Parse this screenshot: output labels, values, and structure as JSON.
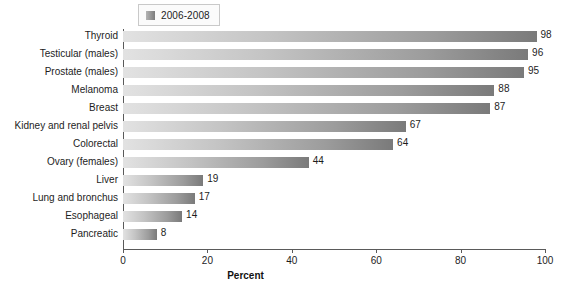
{
  "legend": {
    "swatch_icon": "legend-swatch-icon",
    "entries": [
      "2006-2008"
    ]
  },
  "axis": {
    "x_title": "Percent",
    "x_ticks": [
      "0",
      "20",
      "40",
      "60",
      "80",
      "100"
    ]
  },
  "colors": {
    "bar_light": "#e2e2e2",
    "bar_dark": "#7a7a7a",
    "axis": "#5a5a5a",
    "text": "#1d1d1d",
    "background": "#ffffff"
  },
  "chart_data": {
    "type": "bar",
    "orientation": "horizontal",
    "title": "",
    "subtitle": "",
    "xlabel": "Percent",
    "ylabel": "",
    "xlim": [
      0,
      100
    ],
    "xticks": [
      0,
      20,
      40,
      60,
      80,
      100
    ],
    "grid": false,
    "legend_position": "top-left",
    "categories": [
      "Thyroid",
      "Testicular (males)",
      "Prostate (males)",
      "Melanoma",
      "Breast",
      "Kidney and renal pelvis",
      "Colorectal",
      "Ovary (females)",
      "Liver",
      "Lung and bronchus",
      "Esophageal",
      "Pancreatic"
    ],
    "series": [
      {
        "name": "2006-2008",
        "values": [
          98,
          96,
          95,
          88,
          87,
          67,
          64,
          44,
          19,
          17,
          14,
          8
        ]
      }
    ],
    "data_labels": [
      "98",
      "96",
      "95",
      "88",
      "87",
      "67",
      "64",
      "44",
      "19",
      "17",
      "14",
      "8"
    ]
  }
}
